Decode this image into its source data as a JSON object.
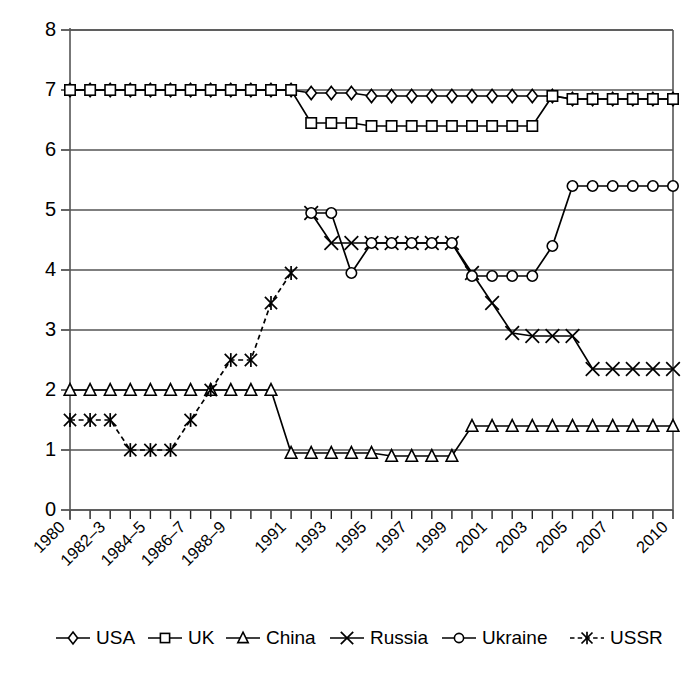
{
  "chart_data": {
    "type": "line",
    "title": "",
    "xlabel": "",
    "ylabel": "",
    "ylim": [
      0,
      8
    ],
    "yticks": [
      0,
      1,
      2,
      3,
      4,
      5,
      6,
      7,
      8
    ],
    "grid": true,
    "legend_position": "bottom",
    "x": [
      1980,
      1981,
      1982,
      1983,
      1984,
      1985,
      1986,
      1987,
      1988,
      1989,
      1990,
      1991,
      1992,
      1993,
      1994,
      1995,
      1996,
      1997,
      1998,
      1999,
      2000,
      2001,
      2002,
      2003,
      2004,
      2005,
      2006,
      2007,
      2008,
      2009,
      2010
    ],
    "xtick_labels": [
      "1980",
      "",
      "1982–3",
      "",
      "1984–5",
      "",
      "1986–7",
      "",
      "1988–9",
      "",
      "",
      "1991",
      "",
      "1993",
      "",
      "1995",
      "",
      "1997",
      "",
      "1999",
      "",
      "2001",
      "",
      "2003",
      "",
      "2005",
      "",
      "2007",
      "",
      "",
      "2010"
    ],
    "series": [
      {
        "name": "USA",
        "marker": "diamond",
        "dashed": false,
        "values": [
          7.0,
          7.0,
          7.0,
          7.0,
          7.0,
          7.0,
          7.0,
          7.0,
          7.0,
          7.0,
          7.0,
          7.0,
          6.95,
          6.95,
          6.95,
          6.9,
          6.9,
          6.9,
          6.9,
          6.9,
          6.9,
          6.9,
          6.9,
          6.9,
          6.9,
          6.85,
          6.85,
          6.85,
          6.85,
          6.85,
          6.85
        ]
      },
      {
        "name": "UK",
        "marker": "square",
        "dashed": false,
        "values": [
          7.0,
          7.0,
          7.0,
          7.0,
          7.0,
          7.0,
          7.0,
          7.0,
          7.0,
          7.0,
          7.0,
          7.0,
          6.45,
          6.45,
          6.45,
          6.4,
          6.4,
          6.4,
          6.4,
          6.4,
          6.4,
          6.4,
          6.4,
          6.4,
          6.9,
          6.85,
          6.85,
          6.85,
          6.85,
          6.85,
          6.85
        ]
      },
      {
        "name": "China",
        "marker": "triangle",
        "dashed": false,
        "values": [
          2.0,
          2.0,
          2.0,
          2.0,
          2.0,
          2.0,
          2.0,
          2.0,
          2.0,
          2.0,
          2.0,
          0.95,
          0.95,
          0.95,
          0.95,
          0.95,
          0.9,
          0.9,
          0.9,
          0.9,
          1.4,
          1.4,
          1.4,
          1.4,
          1.4,
          1.4,
          1.4,
          1.4,
          1.4,
          1.4,
          1.4
        ]
      },
      {
        "name": "Russia",
        "marker": "cross",
        "dashed": false,
        "values": [
          null,
          null,
          null,
          null,
          null,
          null,
          null,
          null,
          null,
          null,
          null,
          null,
          4.95,
          4.45,
          4.45,
          4.45,
          4.45,
          4.45,
          4.45,
          4.45,
          3.95,
          3.45,
          2.95,
          2.9,
          2.9,
          2.9,
          2.35,
          2.35,
          2.35,
          2.35,
          2.35
        ]
      },
      {
        "name": "Ukraine",
        "marker": "circle",
        "dashed": false,
        "values": [
          null,
          null,
          null,
          null,
          null,
          null,
          null,
          null,
          null,
          null,
          null,
          null,
          4.95,
          4.95,
          3.95,
          4.45,
          4.45,
          4.45,
          4.45,
          4.45,
          3.9,
          3.9,
          3.9,
          3.9,
          4.4,
          5.4,
          5.4,
          5.4,
          5.4,
          5.4,
          5.4
        ]
      },
      {
        "name": "USSR",
        "marker": "asterisk",
        "dashed": true,
        "values": [
          1.5,
          1.5,
          1.5,
          1.0,
          1.0,
          1.0,
          1.5,
          2.0,
          2.5,
          2.5,
          3.45,
          3.95,
          null,
          null,
          null,
          null,
          null,
          null,
          null,
          null,
          null,
          null,
          null,
          null,
          null,
          null,
          null,
          null,
          null,
          null,
          null
        ]
      }
    ]
  },
  "legend": {
    "items": [
      {
        "label": "USA",
        "marker": "diamond",
        "dashed": false
      },
      {
        "label": "UK",
        "marker": "square",
        "dashed": false
      },
      {
        "label": "China",
        "marker": "triangle",
        "dashed": false
      },
      {
        "label": "Russia",
        "marker": "cross",
        "dashed": false
      },
      {
        "label": "Ukraine",
        "marker": "circle",
        "dashed": false
      },
      {
        "label": "USSR",
        "marker": "asterisk",
        "dashed": true
      }
    ]
  }
}
